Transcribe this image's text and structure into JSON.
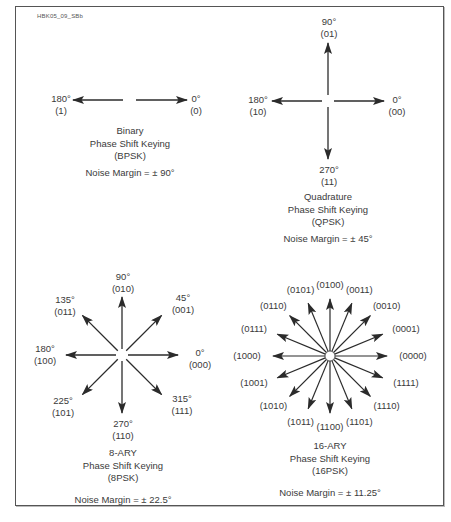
{
  "figure_id": "HBK05_09_SBb",
  "colors": {
    "arrow": "#2b2b2b",
    "text": "#3a3a3a",
    "frame": "#555555"
  },
  "bpsk": {
    "title": "Binary",
    "subtitle": "Phase Shift Keying",
    "abbr": "(BPSK)",
    "noise_margin": "Noise Margin = ± 90°",
    "points": [
      {
        "angle": "0°",
        "code": "(0)"
      },
      {
        "angle": "180°",
        "code": "(1)"
      }
    ]
  },
  "qpsk": {
    "title": "Quadrature",
    "subtitle": "Phase Shift Keying",
    "abbr": "(QPSK)",
    "noise_margin": "Noise Margin = ± 45°",
    "points": [
      {
        "angle": "0°",
        "code": "(00)"
      },
      {
        "angle": "90°",
        "code": "(01)"
      },
      {
        "angle": "180°",
        "code": "(10)"
      },
      {
        "angle": "270°",
        "code": "(11)"
      }
    ]
  },
  "psk8": {
    "title": "8-ARY",
    "subtitle": "Phase Shift Keying",
    "abbr": "(8PSK)",
    "noise_margin": "Noise Margin = ± 22.5°",
    "points": [
      {
        "angle": "0°",
        "code": "(000)"
      },
      {
        "angle": "45°",
        "code": "(001)"
      },
      {
        "angle": "90°",
        "code": "(010)"
      },
      {
        "angle": "135°",
        "code": "(011)"
      },
      {
        "angle": "180°",
        "code": "(100)"
      },
      {
        "angle": "225°",
        "code": "(101)"
      },
      {
        "angle": "270°",
        "code": "(110)"
      },
      {
        "angle": "315°",
        "code": "(111)"
      }
    ]
  },
  "psk16": {
    "title": "16-ARY",
    "subtitle": "Phase Shift Keying",
    "abbr": "(16PSK)",
    "noise_margin": "Noise Margin = ± 11.25°",
    "codes": [
      "(0000)",
      "(0001)",
      "(0010)",
      "(0011)",
      "(0100)",
      "(0101)",
      "(0110)",
      "(0111)",
      "(1000)",
      "(1001)",
      "(1010)",
      "(1011)",
      "(1100)",
      "(1101)",
      "(1110)",
      "(1111)"
    ]
  }
}
